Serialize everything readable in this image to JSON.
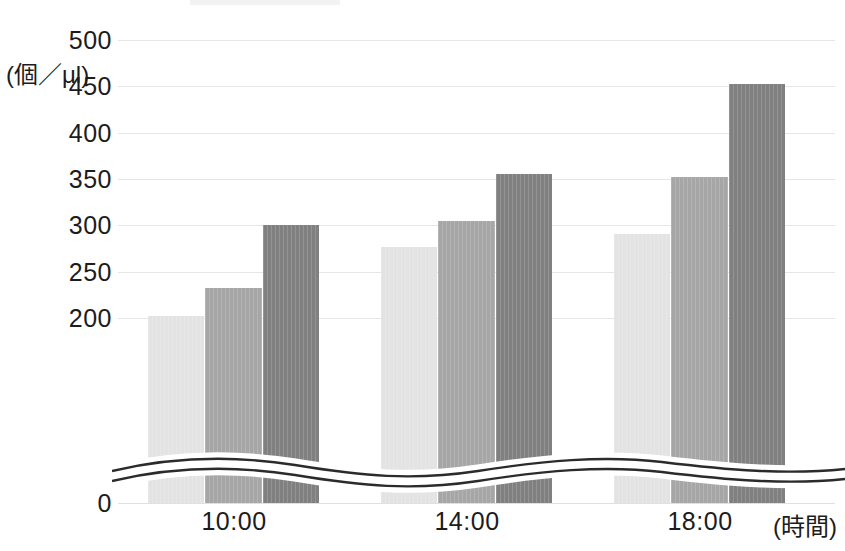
{
  "chart_data": {
    "type": "bar",
    "title": "",
    "subtitle": "",
    "xlabel": "(時間)",
    "ylabel": "(個／μl)",
    "categories": [
      "10:00",
      "14:00",
      "18:00"
    ],
    "series": [
      {
        "name": "series-1-light",
        "color": "#e3e3e3",
        "values": [
          202,
          277,
          290
        ]
      },
      {
        "name": "series-2-medium",
        "color": "#a6a6a6",
        "values": [
          232,
          305,
          352
        ]
      },
      {
        "name": "series-3-dark",
        "color": "#808080",
        "values": [
          300,
          355,
          452
        ]
      }
    ],
    "ylim": [
      0,
      500
    ],
    "ytick_values": [
      0,
      200,
      250,
      300,
      350,
      400,
      450,
      500
    ],
    "ytick_labels": [
      "0",
      "200",
      "250",
      "300",
      "350",
      "400",
      "450",
      "500"
    ],
    "gridlines": true,
    "grid_values": [
      200,
      250,
      300,
      350,
      400,
      450,
      500
    ],
    "legend": "none",
    "axis_break": {
      "present": true,
      "style": "wave",
      "between": [
        0,
        200
      ],
      "note": "y-axis broken between 0 and 200"
    }
  },
  "axis": {
    "unit_caption": "(個／μl)",
    "x_axis_title": "(時間)"
  }
}
